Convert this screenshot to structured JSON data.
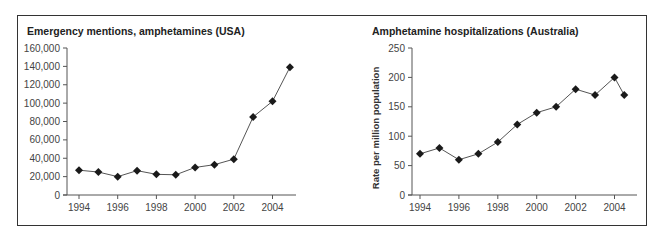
{
  "chart_data": [
    {
      "type": "line",
      "title": "Emergency mentions, amphetamines (USA)",
      "xlabel": "",
      "ylabel": "",
      "x": [
        1994,
        1995,
        1996,
        1997,
        1998,
        1999,
        2000,
        2001,
        2002,
        2003,
        2004,
        2004.9
      ],
      "series": [
        {
          "name": "Emergency mentions",
          "values": [
            27000,
            25000,
            20000,
            26500,
            22500,
            22000,
            30000,
            33000,
            39000,
            85000,
            102000,
            139000
          ]
        }
      ],
      "yticks": [
        0,
        20000,
        40000,
        60000,
        80000,
        100000,
        120000,
        140000,
        160000
      ],
      "ytick_labels": [
        "0",
        "20,000",
        "40,000",
        "60,000",
        "80,000",
        "100,000",
        "120,000",
        "140,000",
        "160,000"
      ],
      "xticks": [
        1994,
        1996,
        1998,
        2000,
        2002,
        2004
      ],
      "xtick_labels": [
        "1994",
        "1996",
        "1998",
        "2000",
        "2002",
        "2004"
      ],
      "ylim": [
        0,
        160000
      ],
      "xlim": [
        1993.5,
        2005.2
      ],
      "grid": false,
      "marker": "diamond"
    },
    {
      "type": "line",
      "title": "Amphetamine hospitalizations (Australia)",
      "xlabel": "",
      "ylabel": "Rate per million population",
      "x": [
        1994,
        1995,
        1996,
        1997,
        1998,
        1999,
        2000,
        2001,
        2002,
        2003,
        2004,
        2004.5
      ],
      "series": [
        {
          "name": "Hospitalizations",
          "values": [
            70,
            80,
            60,
            70,
            90,
            120,
            140,
            150,
            180,
            170,
            200,
            170
          ]
        }
      ],
      "yticks": [
        0,
        50,
        100,
        150,
        200,
        250
      ],
      "ytick_labels": [
        "0",
        "50",
        "100",
        "150",
        "200",
        "250"
      ],
      "xticks": [
        1994,
        1996,
        1998,
        2000,
        2002,
        2004
      ],
      "xtick_labels": [
        "1994",
        "1996",
        "1998",
        "2000",
        "2002",
        "2004"
      ],
      "ylim": [
        0,
        250
      ],
      "xlim": [
        1993.5,
        2005.2
      ],
      "grid": false,
      "marker": "diamond"
    }
  ],
  "layout": {
    "charts": [
      {
        "plot": {
          "x0": 67,
          "y0": 195,
          "x_of_1994": 79,
          "px_per_year": 19.35,
          "y_top": 48,
          "axis_x_end": 296
        },
        "title_pos": [
          27,
          35
        ]
      },
      {
        "plot": {
          "x0": 412,
          "y0": 195,
          "x_of_1994": 420,
          "px_per_year": 19.45,
          "y_top": 48,
          "axis_x_end": 637
        },
        "title_pos": [
          372,
          35
        ],
        "ylabel_pos": [
          379,
          128
        ]
      }
    ]
  }
}
